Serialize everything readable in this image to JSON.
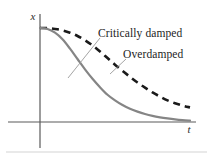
{
  "figure": {
    "background_color": "#ffffff",
    "width": 213,
    "height": 163,
    "baseline_rule_color": "#e2e2e2"
  },
  "axes": {
    "x_label": "t",
    "y_label": "x",
    "axis_color": "#5a5a5a",
    "origin_px": [
      40,
      122
    ],
    "x_axis_end_px": [
      196,
      122
    ],
    "y_axis_top_px": [
      40,
      14
    ],
    "y_axis_bottom_px": [
      40,
      148
    ]
  },
  "labels": {
    "critically_damped": "Critically damped",
    "overdamped": "Overdamped",
    "leader_line_color": "#9a9a9a"
  },
  "chart_data": {
    "type": "line",
    "title": "",
    "subtitle": "",
    "xlabel": "t",
    "ylabel": "x",
    "xlim": [
      0,
      1
    ],
    "ylim": [
      0,
      1
    ],
    "grid": false,
    "legend_position": "inline-annotations",
    "annotations": [
      {
        "text": "Critically damped",
        "target_series": "Critically damped",
        "text_anchor_px": [
          98,
          36
        ],
        "leader_from_px": [
          100,
          38
        ],
        "leader_to_px": [
          68,
          78
        ]
      },
      {
        "text": "Overdamped",
        "target_series": "Overdamped",
        "text_anchor_px": [
          123,
          57
        ],
        "leader_from_px": [
          126,
          59
        ],
        "leader_to_px": [
          110,
          74
        ]
      }
    ],
    "series": [
      {
        "name": "Critically damped",
        "style": "solid",
        "color": "#858585",
        "width_px": 2.2,
        "description": "x(t) = A e^{-wt}(1 + wt); decays to zero fastest without oscillating",
        "x": [
          0.0,
          0.05,
          0.1,
          0.15,
          0.2,
          0.25,
          0.3,
          0.35,
          0.4,
          0.45,
          0.5,
          0.55,
          0.6,
          0.65,
          0.7,
          0.75,
          0.8,
          0.85,
          0.9,
          0.95,
          1.0
        ],
        "y": [
          1.0,
          0.99,
          0.95,
          0.88,
          0.78,
          0.67,
          0.56,
          0.46,
          0.37,
          0.29,
          0.23,
          0.18,
          0.14,
          0.11,
          0.085,
          0.065,
          0.05,
          0.038,
          0.028,
          0.02,
          0.014
        ]
      },
      {
        "name": "Overdamped",
        "style": "dashed",
        "color": "#1a1a1a",
        "width_px": 2.6,
        "dash_pattern": "7,5",
        "description": "Returns to equilibrium more slowly than critical damping, without oscillating",
        "x": [
          0.0,
          0.05,
          0.1,
          0.15,
          0.2,
          0.25,
          0.3,
          0.35,
          0.4,
          0.45,
          0.5,
          0.55,
          0.6,
          0.65,
          0.7,
          0.75,
          0.8,
          0.85,
          0.9,
          0.95,
          1.0
        ],
        "y": [
          1.0,
          1.0,
          0.99,
          0.975,
          0.95,
          0.915,
          0.87,
          0.815,
          0.75,
          0.68,
          0.61,
          0.545,
          0.48,
          0.42,
          0.365,
          0.315,
          0.27,
          0.23,
          0.2,
          0.175,
          0.155
        ]
      }
    ]
  }
}
